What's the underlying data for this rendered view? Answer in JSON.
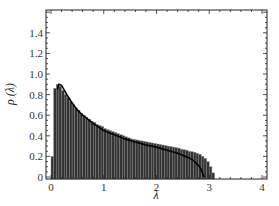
{
  "chart_data": {
    "type": "bar",
    "title": "",
    "xlabel": "λ",
    "ylabel": "ρ (λ)",
    "xlim": [
      -0.1,
      4.05
    ],
    "ylim": [
      0,
      1.6
    ],
    "x_ticks": [
      0,
      1,
      2,
      3,
      4
    ],
    "x_tick_labels": [
      "0",
      "1",
      "2",
      "3",
      "4"
    ],
    "y_ticks": [
      0,
      0.2,
      0.4,
      0.6,
      0.8,
      1.0,
      1.2,
      1.4
    ],
    "y_tick_labels": [
      "0",
      "0.2",
      "0.4",
      "0.6",
      "0.8",
      "1.0",
      "1.2",
      "1.4"
    ],
    "grid": false,
    "legend": null,
    "bin_width": 0.05,
    "bins_start": 0.0,
    "histogram_values": [
      0.2,
      0.86,
      0.9,
      0.88,
      0.84,
      0.8,
      0.77,
      0.73,
      0.7,
      0.67,
      0.65,
      0.62,
      0.6,
      0.58,
      0.56,
      0.54,
      0.53,
      0.51,
      0.5,
      0.49,
      0.47,
      0.46,
      0.45,
      0.44,
      0.43,
      0.42,
      0.41,
      0.4,
      0.39,
      0.38,
      0.37,
      0.365,
      0.36,
      0.355,
      0.35,
      0.345,
      0.34,
      0.335,
      0.33,
      0.325,
      0.32,
      0.315,
      0.31,
      0.305,
      0.3,
      0.295,
      0.29,
      0.285,
      0.28,
      0.27,
      0.265,
      0.26,
      0.25,
      0.245,
      0.24,
      0.23,
      0.22,
      0.2,
      0.18,
      0.15,
      0.1,
      0.04
    ],
    "curve": {
      "x": [
        0.12,
        0.15,
        0.2,
        0.3,
        0.4,
        0.5,
        0.6,
        0.8,
        1.0,
        1.2,
        1.4,
        1.6,
        1.8,
        2.0,
        2.2,
        2.4,
        2.6,
        2.7,
        2.8,
        2.85,
        2.9
      ],
      "y": [
        0.85,
        0.9,
        0.89,
        0.8,
        0.72,
        0.65,
        0.6,
        0.52,
        0.45,
        0.41,
        0.37,
        0.34,
        0.31,
        0.29,
        0.26,
        0.23,
        0.19,
        0.16,
        0.11,
        0.07,
        0.0
      ]
    },
    "bar_color": "#333333",
    "curve_color": "#000000"
  }
}
